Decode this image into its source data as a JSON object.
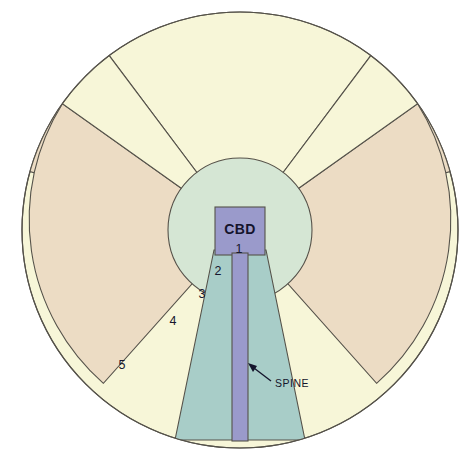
{
  "diagram": {
    "type": "concentric-sector-spine-model",
    "center": {
      "x": 240,
      "y": 230
    },
    "outer_radius": 218,
    "labels": {
      "cbd": "CBD",
      "spine": "SPINE"
    },
    "zones": [
      {
        "id": "1",
        "label": "1",
        "name": "cbd-zone",
        "x": 239,
        "y": 249,
        "color": "#9a9acb"
      },
      {
        "id": "2",
        "label": "2",
        "name": "inner-spine-zone",
        "x": 218,
        "y": 271,
        "color": "#a8cdc8"
      },
      {
        "id": "3",
        "label": "3",
        "name": "inner-ring-zone",
        "x": 202,
        "y": 294,
        "color": "#d5e6d4"
      },
      {
        "id": "4",
        "label": "4",
        "name": "middle-sector-zone",
        "x": 173,
        "y": 321,
        "color": "#ecdcc4"
      },
      {
        "id": "5",
        "label": "5",
        "name": "outer-ring-zone",
        "x": 122,
        "y": 365,
        "color": "#f7f6d8"
      }
    ],
    "colors": {
      "outer_ring": "#f7f6d8",
      "sector_tan": "#ecdcc4",
      "inner_circle": "#d5e6d4",
      "spine_wedge": "#a8cdc8",
      "spine_bar": "#9a9acb",
      "outline": "#55524a",
      "text": "#16162e",
      "background": "#ffffff"
    }
  }
}
